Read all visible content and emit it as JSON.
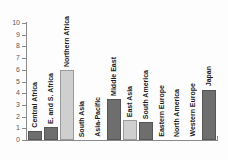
{
  "chart_data": {
    "type": "bar",
    "title": "",
    "xlabel": "",
    "ylabel": "",
    "ylim": [
      0,
      10
    ],
    "grid": false,
    "legend": "none",
    "y_ticks": [
      "0",
      "1",
      "2",
      "3",
      "4",
      "5",
      "6",
      "7",
      "8",
      "9",
      "10"
    ],
    "categories": [
      "Central Africa",
      "E. and S. Africa",
      "Northern Africa",
      "South Asia",
      "Asia-Pacific",
      "Middle East",
      "East Asia",
      "South America",
      "Eastern Europe",
      "North America",
      "Western Europe",
      "Japan"
    ],
    "values": [
      0.8,
      1.1,
      6.0,
      0,
      0,
      3.5,
      1.7,
      1.5,
      0,
      0,
      0,
      4.3
    ],
    "bar_shades": [
      "dark",
      "dark",
      "light",
      "dark",
      "dark",
      "dark",
      "light",
      "dark",
      "dark",
      "dark",
      "dark",
      "dark"
    ]
  },
  "colors": {
    "bar_dark": "#6e6e6e",
    "bar_light": "#cfcfcf",
    "axis": "#8a8a8a",
    "tick_label": "#5a5a5a",
    "category_label": "#1a1a1a",
    "background": "#fdfdfd"
  }
}
